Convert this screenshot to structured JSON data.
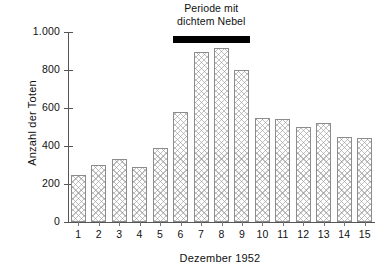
{
  "chart_data": {
    "type": "bar",
    "title": "",
    "annotation": {
      "line1": "Periode mit",
      "line2": "dichtem Nebel",
      "marker": "black-bar",
      "covers_categories": [
        "6",
        "7",
        "8",
        "9"
      ]
    },
    "categories": [
      "1",
      "2",
      "3",
      "4",
      "5",
      "6",
      "7",
      "8",
      "9",
      "10",
      "11",
      "12",
      "13",
      "14",
      "15"
    ],
    "values": [
      250,
      300,
      330,
      290,
      390,
      580,
      895,
      915,
      800,
      550,
      540,
      500,
      520,
      450,
      440
    ],
    "xlabel": "Dezember 1952",
    "ylabel": "Anzahl der Toten",
    "ylim": [
      0,
      1000
    ],
    "ytick_values": [
      0,
      200,
      400,
      600,
      800,
      1000
    ],
    "ytick_labels": [
      "0",
      "200",
      "400",
      "600",
      "800",
      "1.000"
    ],
    "grid": false,
    "legend": "none",
    "bar_fill": "crosshatch",
    "bar_edge_color": "#8c8c8c",
    "axis_color": "#555555",
    "text_color": "#111111",
    "marker_color": "#000000",
    "background": "#ffffff"
  }
}
